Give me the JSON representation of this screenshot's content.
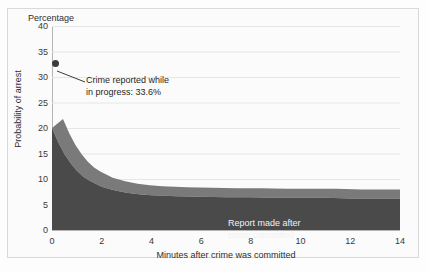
{
  "chart_data": {
    "type": "area",
    "title": "",
    "top_axis_label": "Percentage",
    "xlabel": "Minutes after crime was committed",
    "ylabel": "Probability of arrest",
    "xlim": [
      0,
      14
    ],
    "ylim": [
      0,
      40
    ],
    "xticks": [
      0,
      2,
      4,
      6,
      8,
      10,
      12,
      14
    ],
    "yticks": [
      0,
      5,
      10,
      15,
      20,
      25,
      30,
      35,
      40
    ],
    "grid": true,
    "legend": "none",
    "style": "3d-area",
    "series": [
      {
        "name": "Report made after crime committed",
        "x": [
          0,
          0.25,
          0.5,
          0.75,
          1,
          1.25,
          1.5,
          2,
          2.5,
          3,
          3.5,
          4,
          5,
          6,
          7,
          8,
          9,
          10,
          11,
          12,
          13,
          14
        ],
        "values": [
          20.0,
          17.2,
          14.9,
          13.1,
          11.6,
          10.5,
          9.7,
          8.5,
          7.8,
          7.3,
          7.0,
          6.8,
          6.6,
          6.5,
          6.4,
          6.4,
          6.3,
          6.3,
          6.3,
          6.2,
          6.2,
          6.2
        ]
      }
    ],
    "annotations": [
      {
        "name": "crime-in-progress",
        "text": "Crime reported while\nin progress: 33.6%",
        "point_x": 0,
        "point_y": 32.6,
        "value": 33.6
      }
    ],
    "series_label": "Report made after\ncrime committed",
    "colors": {
      "area_front": "#4a4a4a",
      "area_top": "#7a7a7a",
      "area_end": "#2f2f2f",
      "grid": "#e6e6e6",
      "axis": "#b5b5b5",
      "text": "#2e2e2e",
      "label_text": "#f2f2f2",
      "marker": "#3b3b3b",
      "background": "#fbfbfb"
    }
  }
}
